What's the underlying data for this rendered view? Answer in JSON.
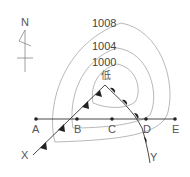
{
  "compass": {
    "label": "N"
  },
  "isobars": [
    {
      "value": "1008"
    },
    {
      "value": "1004"
    },
    {
      "value": "1000"
    }
  ],
  "low_pressure": {
    "label": "低"
  },
  "line_points": [
    {
      "label": "A"
    },
    {
      "label": "B"
    },
    {
      "label": "C"
    },
    {
      "label": "D"
    },
    {
      "label": "E"
    }
  ],
  "fronts": {
    "cold_front_end": "X",
    "warm_front_end": "Y"
  },
  "colors": {
    "line": "#333333",
    "isobar": "#999999",
    "label": "#555555"
  }
}
